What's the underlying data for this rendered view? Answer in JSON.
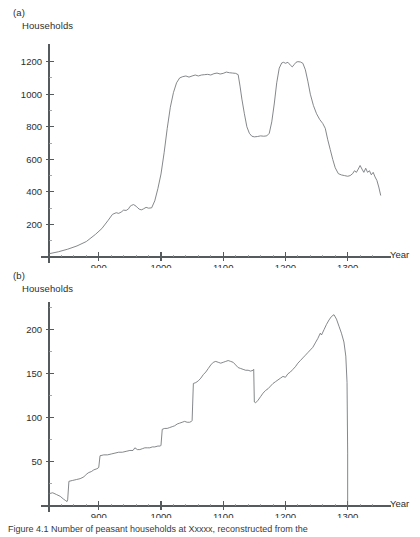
{
  "figure": {
    "caption": "Figure 4.1  Number of peasant households at Xxxxx, reconstructed from the"
  },
  "panels": [
    {
      "id": "a",
      "label": "(a)",
      "y_axis_title": "Households",
      "x_axis_title": "Year"
    },
    {
      "id": "b",
      "label": "(b)",
      "y_axis_title": "Households",
      "x_axis_title": "Year"
    }
  ],
  "chart_data": [
    {
      "type": "line",
      "panel": "a",
      "title": "(a)",
      "xlabel": "Year",
      "ylabel": "Households",
      "xlim": [
        820,
        1360
      ],
      "ylim": [
        0,
        1290
      ],
      "xticks": [
        900,
        1000,
        1100,
        1200,
        1300
      ],
      "xticklabels": [
        "900",
        "1000",
        "1100",
        "1200",
        "1300"
      ],
      "xminorticks": [
        840,
        860,
        880,
        920,
        940,
        960,
        980,
        1020,
        1040,
        1060,
        1080,
        1120,
        1140,
        1160,
        1180,
        1220,
        1240,
        1260,
        1280,
        1320,
        1340
      ],
      "yticks": [
        200,
        400,
        600,
        800,
        1000,
        1200
      ],
      "yticklabels": [
        "200",
        "400",
        "600",
        "800",
        "1000",
        "1200"
      ],
      "yminorticks": [
        100,
        300,
        500,
        700,
        900,
        1100
      ],
      "grid": false,
      "legend": false,
      "series": [
        {
          "name": "Households",
          "x": [
            820,
            835,
            850,
            865,
            880,
            895,
            905,
            915,
            922,
            928,
            932,
            936,
            940,
            944,
            948,
            950,
            953,
            956,
            960,
            963,
            966,
            969,
            972,
            976,
            980,
            985,
            990,
            995,
            1000,
            1005,
            1010,
            1015,
            1020,
            1025,
            1030,
            1035,
            1040,
            1045,
            1050,
            1055,
            1060,
            1065,
            1070,
            1075,
            1080,
            1085,
            1090,
            1095,
            1100,
            1105,
            1110,
            1115,
            1120,
            1124,
            1127,
            1130,
            1134,
            1138,
            1142,
            1146,
            1150,
            1155,
            1160,
            1165,
            1170,
            1174,
            1178,
            1182,
            1186,
            1190,
            1194,
            1197,
            1200,
            1204,
            1208,
            1211,
            1214,
            1217,
            1220,
            1224,
            1228,
            1232,
            1236,
            1240,
            1245,
            1250,
            1255,
            1260,
            1264,
            1268,
            1272,
            1276,
            1280,
            1285,
            1290,
            1295,
            1300,
            1304,
            1308,
            1311,
            1314,
            1317,
            1320,
            1323,
            1326,
            1329,
            1332,
            1335,
            1338,
            1341,
            1344,
            1347,
            1350,
            1353
          ],
          "y": [
            20,
            32,
            48,
            68,
            95,
            140,
            175,
            225,
            262,
            272,
            268,
            276,
            288,
            286,
            296,
            310,
            318,
            322,
            312,
            300,
            292,
            290,
            296,
            305,
            300,
            302,
            345,
            420,
            510,
            640,
            790,
            920,
            1010,
            1070,
            1100,
            1108,
            1112,
            1105,
            1112,
            1118,
            1112,
            1118,
            1120,
            1122,
            1118,
            1126,
            1130,
            1124,
            1128,
            1136,
            1132,
            1130,
            1128,
            1120,
            1050,
            970,
            880,
            800,
            760,
            742,
            738,
            740,
            744,
            742,
            744,
            760,
            830,
            940,
            1070,
            1160,
            1192,
            1196,
            1190,
            1196,
            1178,
            1168,
            1182,
            1196,
            1200,
            1198,
            1190,
            1150,
            1080,
            1000,
            930,
            880,
            845,
            820,
            790,
            720,
            660,
            600,
            548,
            512,
            504,
            500,
            496,
            500,
            512,
            530,
            520,
            540,
            562,
            540,
            520,
            545,
            520,
            530,
            505,
            520,
            492,
            470,
            430,
            380
          ]
        }
      ]
    },
    {
      "type": "line",
      "panel": "b",
      "title": "(b)",
      "xlabel": "Year",
      "ylabel": "Households",
      "xlim": [
        820,
        1360
      ],
      "ylim": [
        0,
        228
      ],
      "xticks": [
        900,
        1000,
        1100,
        1200,
        1300
      ],
      "xticklabels": [
        "900",
        "1000",
        "1100",
        "1200",
        "1300"
      ],
      "xminorticks": [
        840,
        860,
        880,
        920,
        940,
        960,
        980,
        1020,
        1040,
        1060,
        1080,
        1120,
        1140,
        1160,
        1180,
        1220,
        1240,
        1260,
        1280,
        1320,
        1340
      ],
      "yticks": [
        50,
        100,
        150,
        200
      ],
      "yticklabels": [
        "50",
        "100",
        "150",
        "200"
      ],
      "yminorticks": [
        25,
        75,
        125,
        175,
        225
      ],
      "grid": false,
      "legend": false,
      "series": [
        {
          "name": "Households",
          "x": [
            820,
            826,
            832,
            838,
            843,
            847,
            849,
            850,
            852,
            858,
            864,
            870,
            876,
            880,
            884,
            888,
            892,
            896,
            899,
            900,
            902,
            908,
            914,
            920,
            926,
            932,
            938,
            944,
            950,
            955,
            958,
            962,
            966,
            970,
            974,
            978,
            982,
            986,
            990,
            995,
            999,
            1000,
            1002,
            1006,
            1010,
            1014,
            1018,
            1022,
            1026,
            1030,
            1034,
            1038,
            1042,
            1046,
            1049,
            1050,
            1052,
            1056,
            1060,
            1064,
            1068,
            1072,
            1076,
            1080,
            1084,
            1088,
            1092,
            1096,
            1100,
            1104,
            1108,
            1112,
            1116,
            1120,
            1124,
            1128,
            1132,
            1136,
            1140,
            1144,
            1148,
            1149,
            1150,
            1152,
            1156,
            1160,
            1164,
            1168,
            1172,
            1176,
            1180,
            1184,
            1188,
            1192,
            1196,
            1200,
            1204,
            1208,
            1212,
            1216,
            1220,
            1224,
            1228,
            1232,
            1236,
            1240,
            1244,
            1248,
            1252,
            1256,
            1258,
            1262,
            1266,
            1270,
            1274,
            1278,
            1282,
            1286,
            1290,
            1294,
            1297,
            1299,
            1300,
            1300
          ],
          "y": [
            14,
            15,
            13,
            11,
            8,
            6,
            5,
            7,
            28,
            29,
            30,
            31,
            33,
            36,
            38,
            39,
            41,
            42,
            43,
            44,
            57,
            58,
            58,
            59,
            60,
            61,
            61,
            62,
            63,
            63,
            66,
            64,
            64,
            65,
            66,
            66,
            66,
            67,
            67,
            68,
            68,
            69,
            87,
            88,
            88,
            89,
            90,
            91,
            93,
            94,
            95,
            96,
            95,
            95,
            96,
            97,
            139,
            140,
            142,
            145,
            149,
            152,
            156,
            160,
            163,
            164,
            163,
            162,
            163,
            164,
            165,
            164,
            163,
            160,
            157,
            156,
            155,
            154,
            154,
            153,
            154,
            155,
            118,
            117,
            120,
            124,
            128,
            131,
            133,
            136,
            139,
            141,
            143,
            145,
            147,
            146,
            150,
            152,
            155,
            158,
            162,
            165,
            168,
            171,
            174,
            177,
            180,
            185,
            190,
            196,
            194,
            200,
            206,
            211,
            215,
            217,
            212,
            204,
            196,
            186,
            170,
            140,
            60,
            0
          ]
        }
      ]
    }
  ]
}
